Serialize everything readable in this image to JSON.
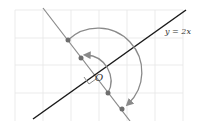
{
  "diagram": {
    "type": "coordinate-rotation",
    "line_label": "y = 2x",
    "origin_label": "O",
    "colors": {
      "grid": "#e6e6e6",
      "main_line": "#1a1a1a",
      "perpendicular_line": "#8a8a8a",
      "arcs": "#8a8a8a",
      "points": "#6e6e6e",
      "text": "#333333"
    },
    "points_on_perpendicular": 4,
    "rotation_arcs": 2,
    "right_angle_marker": true
  }
}
